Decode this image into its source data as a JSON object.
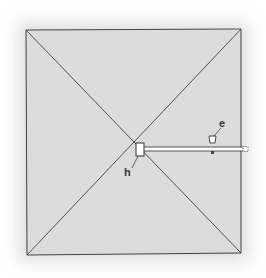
{
  "diagram": {
    "labels": {
      "h": "h",
      "e": "e"
    },
    "colors": {
      "sheet": "#dcdcdc",
      "line": "#444444",
      "rod": "#ffffff"
    }
  }
}
